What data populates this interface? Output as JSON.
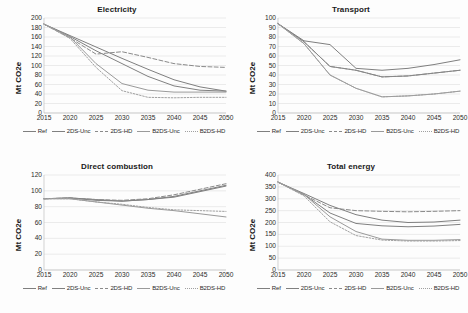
{
  "figure": {
    "ylabel": "Mt CO2e",
    "xticks": [
      "2015",
      "2020",
      "2025",
      "2030",
      "2035",
      "2040",
      "2045",
      "2050"
    ],
    "legend_labels": [
      "Ref",
      "2DS-Unc",
      "2DS-HD",
      "B2DS-Unc",
      "B2DS-HD"
    ],
    "series_styles": [
      {
        "name": "Ref",
        "color": "#7f7f7f",
        "dash": "none",
        "width": 1.0
      },
      {
        "name": "2DS-Unc",
        "color": "#808080",
        "dash": "none",
        "width": 1.0
      },
      {
        "name": "2DS-HD",
        "color": "#8a8a8a",
        "dash": "dashed",
        "width": 1.0
      },
      {
        "name": "B2DS-Unc",
        "color": "#9a9a9a",
        "dash": "none",
        "width": 1.0
      },
      {
        "name": "B2DS-HD",
        "color": "#a0a0a0",
        "dash": "dotted",
        "width": 1.0
      }
    ]
  },
  "chart_data": [
    {
      "id": "electricity",
      "type": "line",
      "title": "Electricity",
      "xlabel": "",
      "ylabel": "Mt CO2e",
      "x": [
        2015,
        2020,
        2025,
        2030,
        2035,
        2040,
        2045,
        2050
      ],
      "xlim": [
        2015,
        2050
      ],
      "ylim": [
        0,
        200
      ],
      "yticks": [
        0,
        20,
        40,
        60,
        80,
        100,
        120,
        140,
        160,
        180,
        200
      ],
      "grid": true,
      "legend_position": "bottom",
      "series": [
        {
          "name": "Ref",
          "values": [
            187,
            163,
            139,
            115,
            92,
            70,
            55,
            46
          ]
        },
        {
          "name": "2DS-Unc",
          "values": [
            187,
            161,
            131,
            104,
            77,
            57,
            48,
            46
          ]
        },
        {
          "name": "2DS-HD",
          "values": [
            187,
            158,
            124,
            129,
            117,
            104,
            98,
            96
          ]
        },
        {
          "name": "B2DS-Unc",
          "values": [
            187,
            160,
            104,
            62,
            48,
            44,
            44,
            44
          ]
        },
        {
          "name": "B2DS-HD",
          "values": [
            187,
            157,
            96,
            47,
            33,
            32,
            33,
            33
          ]
        }
      ]
    },
    {
      "id": "transport",
      "type": "line",
      "title": "Transport",
      "xlabel": "",
      "ylabel": "Mt CO2e",
      "x": [
        2015,
        2020,
        2025,
        2030,
        2035,
        2040,
        2045,
        2050
      ],
      "xlim": [
        2015,
        2050
      ],
      "ylim": [
        0,
        100
      ],
      "yticks": [
        0,
        10,
        20,
        30,
        40,
        50,
        60,
        70,
        80,
        90,
        100
      ],
      "grid": true,
      "legend_position": "bottom",
      "series": [
        {
          "name": "Ref",
          "values": [
            94,
            76,
            72,
            47,
            45,
            47,
            51,
            56
          ]
        },
        {
          "name": "2DS-Unc",
          "values": [
            94,
            75,
            49,
            45,
            38,
            39,
            42,
            45
          ]
        },
        {
          "name": "2DS-HD",
          "values": [
            94,
            75,
            49,
            45,
            38,
            39,
            42,
            45
          ]
        },
        {
          "name": "B2DS-Unc",
          "values": [
            94,
            73,
            40,
            26,
            17,
            18,
            20,
            23
          ]
        },
        {
          "name": "B2DS-HD",
          "values": [
            94,
            73,
            40,
            26,
            17,
            18,
            20,
            23
          ]
        }
      ]
    },
    {
      "id": "direct-combustion",
      "type": "line",
      "title": "Direct combustion",
      "xlabel": "",
      "ylabel": "Mt CO2e",
      "x": [
        2015,
        2020,
        2025,
        2030,
        2035,
        2040,
        2045,
        2050
      ],
      "xlim": [
        2015,
        2050
      ],
      "ylim": [
        0,
        120
      ],
      "yticks": [
        0,
        20,
        40,
        60,
        80,
        100,
        120
      ],
      "grid": true,
      "legend_position": "bottom",
      "series": [
        {
          "name": "Ref",
          "values": [
            90,
            91,
            89,
            87,
            89,
            92,
            99,
            106
          ]
        },
        {
          "name": "2DS-Unc",
          "values": [
            90,
            91,
            88,
            87,
            89,
            93,
            100,
            107
          ]
        },
        {
          "name": "2DS-HD",
          "values": [
            90,
            91,
            89,
            88,
            90,
            95,
            102,
            109
          ]
        },
        {
          "name": "B2DS-Unc",
          "values": [
            90,
            90,
            86,
            82,
            78,
            75,
            71,
            67
          ]
        },
        {
          "name": "B2DS-HD",
          "values": [
            90,
            90,
            86,
            83,
            79,
            76,
            75,
            74
          ]
        }
      ]
    },
    {
      "id": "total-energy",
      "type": "line",
      "title": "Total energy",
      "xlabel": "",
      "ylabel": "Mt CO2e",
      "x": [
        2015,
        2020,
        2025,
        2030,
        2035,
        2040,
        2045,
        2050
      ],
      "xlim": [
        2015,
        2050
      ],
      "ylim": [
        0,
        400
      ],
      "yticks": [
        0,
        50,
        100,
        150,
        200,
        250,
        300,
        350,
        400
      ],
      "grid": true,
      "legend_position": "bottom",
      "series": [
        {
          "name": "Ref",
          "values": [
            370,
            322,
            272,
            233,
            210,
            200,
            202,
            210
          ]
        },
        {
          "name": "2DS-Unc",
          "values": [
            370,
            318,
            240,
            196,
            186,
            182,
            185,
            192
          ]
        },
        {
          "name": "2DS-HD",
          "values": [
            370,
            316,
            262,
            250,
            247,
            245,
            247,
            250
          ]
        },
        {
          "name": "B2DS-Unc",
          "values": [
            370,
            318,
            224,
            162,
            130,
            125,
            125,
            128
          ]
        },
        {
          "name": "B2DS-HD",
          "values": [
            370,
            312,
            203,
            145,
            126,
            122,
            122,
            124
          ]
        }
      ]
    }
  ]
}
